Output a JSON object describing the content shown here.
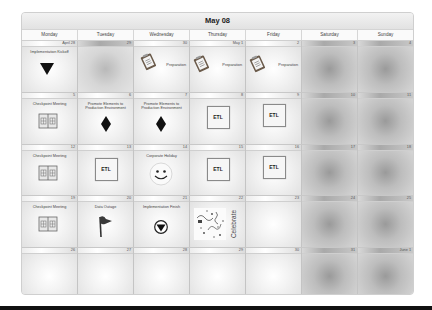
{
  "calendar": {
    "title": "May 08",
    "day_names": [
      "Monday",
      "Tuesday",
      "Wednesday",
      "Thursday",
      "Friday",
      "Saturday",
      "Sunday"
    ],
    "weeks": [
      [
        {
          "date": "April 28",
          "event": "Implementation Kickoff",
          "icon": "triangle-down-icon"
        },
        {
          "date": "29"
        },
        {
          "date": "30",
          "event": "Preparation",
          "icon": "clipboard-icon"
        },
        {
          "date": "May 1",
          "event": "Preparation",
          "icon": "clipboard-icon"
        },
        {
          "date": "2",
          "event": "Preparation",
          "icon": "clipboard-icon"
        },
        {
          "date": "3",
          "weekend": true
        },
        {
          "date": "4",
          "weekend": true
        }
      ],
      [
        {
          "date": "5",
          "event": "Checkpoint Meeting",
          "icon": "calendar-book-icon"
        },
        {
          "date": "6",
          "event": "Promote Elements to Production Environment",
          "icon": "diamond-icon"
        },
        {
          "date": "7",
          "event": "Promote Elements to Production Environment",
          "icon": "diamond-icon"
        },
        {
          "date": "8",
          "event": "ETL",
          "icon": "etl-box-icon"
        },
        {
          "date": "9",
          "event": "ETL",
          "icon": "etl-box-icon"
        },
        {
          "date": "10",
          "weekend": true
        },
        {
          "date": "11",
          "weekend": true
        }
      ],
      [
        {
          "date": "12",
          "event": "Checkpoint Meeting",
          "icon": "calendar-book-icon"
        },
        {
          "date": "13",
          "event": "ETL",
          "icon": "etl-box-icon"
        },
        {
          "date": "14",
          "event": "Corporate Holiday",
          "icon": "smiley-icon"
        },
        {
          "date": "15",
          "event": "ETL",
          "icon": "etl-box-icon"
        },
        {
          "date": "16",
          "event": "ETL",
          "icon": "etl-box-icon"
        },
        {
          "date": "17",
          "weekend": true
        },
        {
          "date": "18",
          "weekend": true
        }
      ],
      [
        {
          "date": "19",
          "event": "Checkpoint Meeting",
          "icon": "calendar-book-icon"
        },
        {
          "date": "20",
          "event": "Data Outage",
          "icon": "flag-icon"
        },
        {
          "date": "21",
          "event": "Implementation Finish",
          "icon": "circle-triangle-icon"
        },
        {
          "date": "22",
          "event": "Celebrate",
          "icon": "confetti-icon"
        },
        {
          "date": "23"
        },
        {
          "date": "24",
          "weekend": true
        },
        {
          "date": "25",
          "weekend": true
        }
      ],
      [
        {
          "date": "26"
        },
        {
          "date": "27"
        },
        {
          "date": "28"
        },
        {
          "date": "29"
        },
        {
          "date": "30"
        },
        {
          "date": "31",
          "weekend": true
        },
        {
          "date": "June 1",
          "weekend": true
        }
      ]
    ]
  },
  "colors": {
    "border": "#c4c4c4",
    "weekend_center": "#9a9a9a",
    "weekday_center": "#ffffff",
    "bottom_bar": "#111111"
  }
}
